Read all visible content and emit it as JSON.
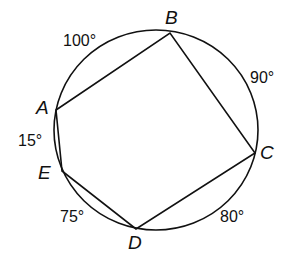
{
  "diagram": {
    "points": {
      "A": "A",
      "B": "B",
      "C": "C",
      "D": "D",
      "E": "E"
    },
    "arcs": {
      "AB": "100°",
      "BC": "90°",
      "CD": "80°",
      "DE": "75°",
      "EA": "15°"
    },
    "colors": {
      "stroke": "#111111",
      "background": "#ffffff"
    }
  }
}
